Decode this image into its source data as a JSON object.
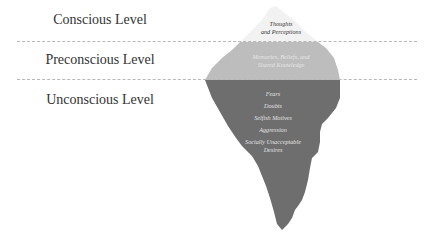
{
  "diagram": {
    "levels": [
      {
        "name": "conscious",
        "label": "Conscious Level"
      },
      {
        "name": "preconscious",
        "label": "Preconscious Level"
      },
      {
        "name": "unconscious",
        "label": "Unconscious Level"
      }
    ],
    "iceberg": {
      "tip": {
        "lines": [
          "Thoughts",
          "and Perceptions"
        ],
        "color": "#f2f2f2"
      },
      "middle": {
        "lines": [
          "Memories, Beliefs, and",
          "Shared Knowledge"
        ],
        "color": "#bdbdbd"
      },
      "deep": {
        "items": [
          "Fears",
          "Doubts",
          "Selfish Motives",
          "Aggression",
          "Socially Unacceptable",
          "Desires"
        ],
        "color": "#6e6e6e"
      }
    },
    "colors": {
      "label_text": "#333333",
      "divider": "#b8b8b8"
    }
  }
}
